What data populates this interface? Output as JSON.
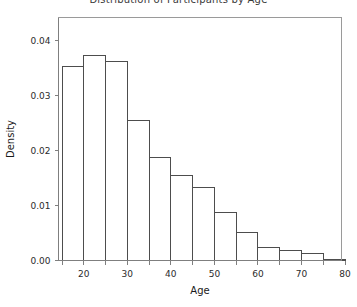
{
  "chart_data": {
    "type": "bar",
    "title": "Distribution of Participants by Age",
    "xlabel": "Age",
    "ylabel": "Density",
    "xlim": [
      15,
      80
    ],
    "ylim": [
      0,
      0.044
    ],
    "grid": false,
    "legend": null,
    "bin_width": 5,
    "bin_edges": [
      15,
      20,
      25,
      30,
      35,
      40,
      45,
      50,
      55,
      60,
      65,
      70,
      75,
      80
    ],
    "categories": [
      "15-20",
      "20-25",
      "25-30",
      "30-35",
      "35-40",
      "40-45",
      "45-50",
      "50-55",
      "55-60",
      "60-65",
      "65-70",
      "70-75",
      "75-80"
    ],
    "values": [
      0.0353,
      0.0372,
      0.0362,
      0.0254,
      0.0188,
      0.0155,
      0.0132,
      0.0088,
      0.0051,
      0.0024,
      0.0018,
      0.0012,
      0.0002
    ],
    "xticks": [
      20,
      30,
      40,
      50,
      60,
      70,
      80
    ],
    "xtick_labels": [
      "20",
      "30",
      "40",
      "50",
      "60",
      "70",
      "80"
    ],
    "yticks": [
      0.0,
      0.01,
      0.02,
      0.03,
      0.04
    ],
    "ytick_labels": [
      "0.00",
      "0.01",
      "0.02",
      "0.03",
      "0.04"
    ],
    "minor_xticks": [
      15,
      25,
      35,
      45,
      55,
      65,
      75
    ],
    "colors": {
      "bar_fill": "#ffffff",
      "bar_stroke": "#4d4d4d",
      "axis": "#7f7f7f",
      "frame": "#9a9a9a",
      "text": "#2b2b2b",
      "background": "#ffffff"
    }
  }
}
